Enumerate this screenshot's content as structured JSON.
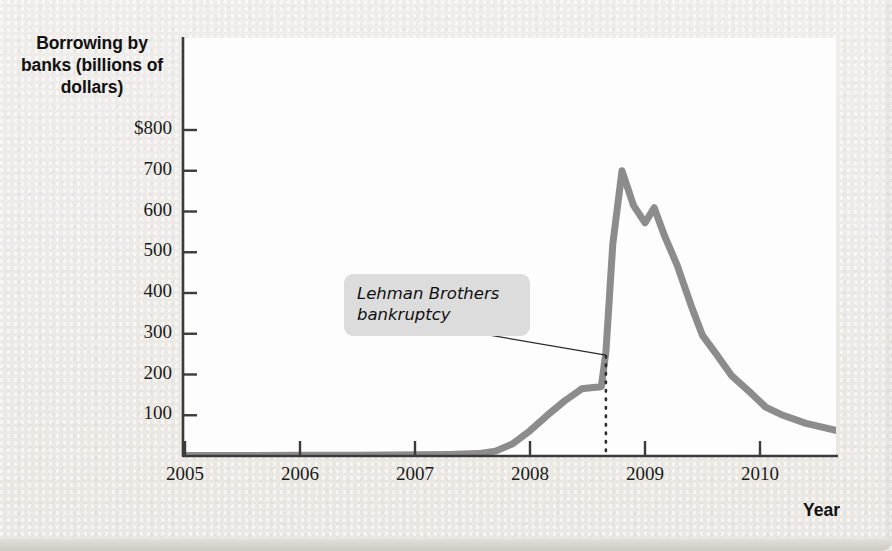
{
  "figure": {
    "y_axis_title": "Borrowing by banks (billions of dollars)",
    "x_axis_title": "Year",
    "annotation_label": "Lehman Brothers\nbankruptcy",
    "line_color": "#8c8c8c",
    "annotation_box_color": "#dcdcdc",
    "page_background": "#edebe7",
    "plot_background": "#fdfdfd",
    "axis_color": "#3b3b3b"
  },
  "chart_data": {
    "type": "line",
    "title": "",
    "xlabel": "Year",
    "ylabel": "Borrowing by banks (billions of dollars)",
    "xlim": [
      2005.0,
      2010.67
    ],
    "ylim": [
      0,
      880
    ],
    "xticks": [
      2005,
      2006,
      2007,
      2008,
      2009,
      2010
    ],
    "xtick_labels": [
      "2005",
      "2006",
      "2007",
      "2008",
      "2009",
      "2010"
    ],
    "yticks": [
      100,
      200,
      300,
      400,
      500,
      600,
      700,
      800
    ],
    "ytick_labels": [
      "100",
      "200",
      "300",
      "400",
      "500",
      "600",
      "700",
      "$800"
    ],
    "grid": false,
    "legend": null,
    "annotations": [
      {
        "text": "Lehman Brothers bankruptcy",
        "points_to_x": 2008.66,
        "marker": "dotted-vertical-line",
        "marker_value_at_curve": 255
      }
    ],
    "series": [
      {
        "name": "Borrowing by banks",
        "units": "billions of dollars",
        "x": [
          2005.0,
          2005.5,
          2006.0,
          2006.5,
          2007.0,
          2007.3,
          2007.55,
          2007.7,
          2007.85,
          2008.0,
          2008.15,
          2008.3,
          2008.45,
          2008.55,
          2008.62,
          2008.66,
          2008.72,
          2008.8,
          2008.9,
          2009.0,
          2009.08,
          2009.17,
          2009.28,
          2009.4,
          2009.5,
          2009.62,
          2009.75,
          2009.9,
          2010.05,
          2010.2,
          2010.4,
          2010.67
        ],
        "y": [
          1,
          1,
          2,
          2,
          3,
          4,
          6,
          12,
          30,
          62,
          100,
          135,
          165,
          168,
          170,
          255,
          520,
          700,
          615,
          572,
          609,
          540,
          468,
          370,
          296,
          250,
          198,
          160,
          120,
          100,
          80,
          62
        ]
      }
    ]
  }
}
